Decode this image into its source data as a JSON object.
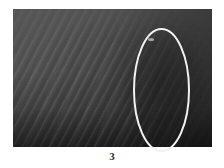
{
  "figure": {
    "caption": "3",
    "kind": "grayscale-photograph"
  },
  "photo": {
    "alt_text": "Grayscale photograph of a rippled sand or sediment surface, with diagonal ripple crests across the left and central area and a darker smooth patch on the right",
    "frame": {
      "left": 13,
      "top": 9,
      "width": 199,
      "height": 138
    },
    "colors": {
      "light_gray": "#585858",
      "mid_gray": "#4c4c4c",
      "dark_gray": "#303030",
      "shadow": "#1e1e1e"
    }
  },
  "annotation": {
    "shape": "ellipse",
    "color": "#f2f2f2",
    "stroke_width": 2,
    "center_x": 161.5,
    "center_y": 90,
    "radius_x": 27.5,
    "radius_y": 61,
    "label": "region-of-interest"
  },
  "background": {
    "color": "#ffffff"
  }
}
